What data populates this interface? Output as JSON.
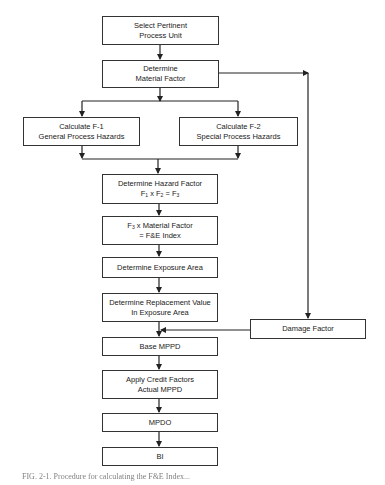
{
  "diagram": {
    "type": "flowchart",
    "nodes": [
      {
        "id": "select_unit",
        "lines": [
          "Select Pertinent",
          "Process Unit"
        ]
      },
      {
        "id": "material_factor",
        "lines": [
          "Determine",
          "Material Factor"
        ]
      },
      {
        "id": "f1",
        "lines": [
          "Calculate F-1",
          "General Process Hazards"
        ]
      },
      {
        "id": "f2",
        "lines": [
          "Calculate F-2",
          "Special Process Hazards"
        ]
      },
      {
        "id": "hazard_factor",
        "lines": [
          "Determine Hazard Factor",
          "F1 x F2 = F3"
        ]
      },
      {
        "id": "fe_index",
        "lines": [
          "F3 x Material Factor",
          "= F&E Index"
        ]
      },
      {
        "id": "exposure_area",
        "lines": [
          "Determine Exposure Area"
        ]
      },
      {
        "id": "replacement_value",
        "lines": [
          "Determine Replacement Value",
          "In Exposure Area"
        ]
      },
      {
        "id": "damage_factor",
        "lines": [
          "Damage Factor"
        ]
      },
      {
        "id": "base_mppd",
        "lines": [
          "Base MPPD"
        ]
      },
      {
        "id": "credit_factors",
        "lines": [
          "Apply Credit Factors",
          "Actual MPPD"
        ]
      },
      {
        "id": "mpdo",
        "lines": [
          "MPDO"
        ]
      },
      {
        "id": "bi",
        "lines": [
          "BI"
        ]
      }
    ],
    "hazard_formula": {
      "prefix": "F",
      "a": "1",
      "op1": " x F",
      "b": "2",
      "op2": " = F",
      "c": "3"
    },
    "fe_formula": {
      "prefix": "F",
      "sub": "3",
      "rest": " x Material Factor"
    },
    "edges": [
      [
        "select_unit",
        "material_factor"
      ],
      [
        "material_factor",
        "f1"
      ],
      [
        "material_factor",
        "f2"
      ],
      [
        "material_factor",
        "damage_factor"
      ],
      [
        "f1",
        "hazard_factor"
      ],
      [
        "f2",
        "hazard_factor"
      ],
      [
        "hazard_factor",
        "fe_index"
      ],
      [
        "fe_index",
        "exposure_area"
      ],
      [
        "exposure_area",
        "replacement_value"
      ],
      [
        "replacement_value",
        "base_mppd"
      ],
      [
        "damage_factor",
        "base_mppd"
      ],
      [
        "base_mppd",
        "credit_factors"
      ],
      [
        "credit_factors",
        "mpdo"
      ],
      [
        "mpdo",
        "bi"
      ]
    ],
    "caption": "FIG. 2-1. Procedure for calculating the F&E Index..."
  }
}
